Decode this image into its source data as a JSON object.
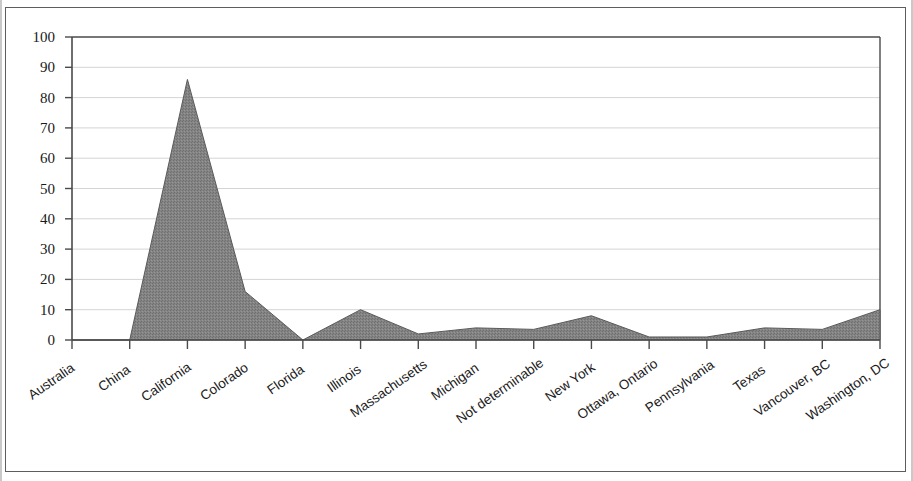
{
  "chart_data": {
    "type": "area",
    "title": "",
    "subtitle": "",
    "xlabel": "",
    "ylabel": "",
    "categories": [
      "Australia",
      "China",
      "California",
      "Colorado",
      "Florida",
      "Illinois",
      "Massachusetts",
      "Michigan",
      "Not determinable",
      "New York",
      "Ottawa, Ontario",
      "Pennsylvania",
      "Texas",
      "Vancouver, BC",
      "Washington, DC"
    ],
    "values": [
      0,
      0,
      86,
      16,
      0,
      10,
      2,
      4,
      3.5,
      8,
      1,
      1,
      4,
      3.5,
      10
    ],
    "ylim": [
      0,
      100
    ],
    "ytick_labels": [
      "100",
      "90",
      "80",
      "70",
      "60",
      "50",
      "40",
      "30",
      "20",
      "10",
      "0"
    ],
    "ytick_values": [
      100,
      90,
      80,
      70,
      60,
      50,
      40,
      30,
      20,
      10,
      0
    ],
    "grid": true,
    "legend": false,
    "legend_position": "none",
    "series": [
      {
        "name": "",
        "values": [
          0,
          0,
          86,
          16,
          0,
          10,
          2,
          4,
          3.5,
          8,
          1,
          1,
          4,
          3.5,
          10
        ]
      }
    ],
    "colors": {
      "area_fill": "#808080",
      "area_line": "#5a5a5a",
      "grid_line": "#d4d4d4",
      "axis_line": "#4a4a4a",
      "text": "#1a1a1a",
      "frame": "#5d5d5d",
      "background": "#ffffff"
    }
  }
}
